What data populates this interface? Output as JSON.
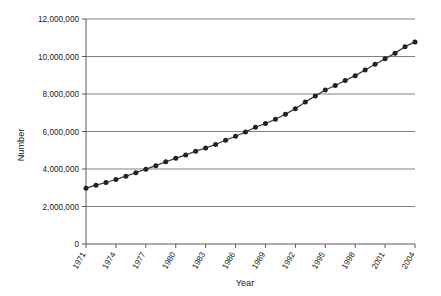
{
  "chart_data": {
    "type": "line",
    "title": "",
    "xlabel": "Year",
    "ylabel": "Number",
    "xlim": [
      1971,
      2004
    ],
    "ylim": [
      0,
      12000000
    ],
    "grid": true,
    "legend": "none",
    "marker": "filled-circle",
    "line_color": "#333333",
    "marker_color": "#222222",
    "grid_color": "#808080",
    "axis_color": "#595959",
    "ytick_labels": [
      "0",
      "2,000,000",
      "4,000,000",
      "6,000,000",
      "8,000,000",
      "10,000,000",
      "12,000,000"
    ],
    "ytick_values": [
      0,
      2000000,
      4000000,
      6000000,
      8000000,
      10000000,
      12000000
    ],
    "xtick_labels": [
      "1971",
      "1974",
      "1977",
      "1980",
      "1983",
      "1986",
      "1989",
      "1992",
      "1995",
      "1998",
      "2001",
      "2004"
    ],
    "xtick_values": [
      1971,
      1974,
      1977,
      1980,
      1983,
      1986,
      1989,
      1992,
      1995,
      1998,
      2001,
      2004
    ],
    "x": [
      1971,
      1972,
      1973,
      1974,
      1975,
      1976,
      1977,
      1978,
      1979,
      1980,
      1981,
      1982,
      1983,
      1984,
      1985,
      1986,
      1987,
      1988,
      1989,
      1990,
      1991,
      1992,
      1993,
      1994,
      1995,
      1996,
      1997,
      1998,
      1999,
      2000,
      2001,
      2002,
      2003,
      2004
    ],
    "values": [
      2980000,
      3140000,
      3280000,
      3440000,
      3620000,
      3800000,
      3990000,
      4180000,
      4390000,
      4570000,
      4750000,
      4950000,
      5120000,
      5310000,
      5530000,
      5750000,
      5970000,
      6230000,
      6430000,
      6650000,
      6920000,
      7220000,
      7570000,
      7900000,
      8210000,
      8450000,
      8720000,
      8980000,
      9280000,
      9590000,
      9880000,
      10180000,
      10520000,
      10780000
    ],
    "series": [
      {
        "name": "Number",
        "values": [
          2980000,
          3140000,
          3280000,
          3440000,
          3620000,
          3800000,
          3990000,
          4180000,
          4390000,
          4570000,
          4750000,
          4950000,
          5120000,
          5310000,
          5530000,
          5750000,
          5970000,
          6230000,
          6430000,
          6650000,
          6920000,
          7220000,
          7570000,
          7900000,
          8210000,
          8450000,
          8720000,
          8980000,
          9280000,
          9590000,
          9880000,
          10180000,
          10520000,
          10780000
        ]
      }
    ]
  }
}
